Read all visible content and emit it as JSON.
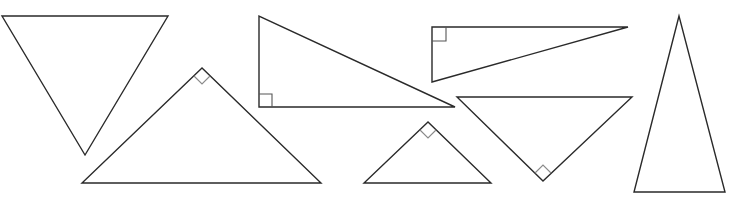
{
  "diagram": {
    "title": "",
    "stroke_color": "#2a2a2a",
    "right_angle_mark_color": "#555555",
    "background": "#ffffff",
    "shapes": [
      {
        "id": "triangle-1",
        "kind": "inverted-isosceles",
        "points": "2,16 168,16 85,155",
        "right_angle": false
      },
      {
        "id": "triangle-2",
        "kind": "right-isosceles",
        "points": "202,68 82,183 321,183",
        "right_angle": true,
        "right_angle_mark": "194,76 202,84 210,76"
      },
      {
        "id": "triangle-3",
        "kind": "right",
        "points": "259,16 259,107 455,107",
        "right_angle": true,
        "right_angle_mark": "259,94 272,94 272,107"
      },
      {
        "id": "triangle-4",
        "kind": "right",
        "points": "432,27 628,27 432,82",
        "right_angle": true,
        "right_angle_mark": "432,41 446,41 446,27"
      },
      {
        "id": "triangle-5",
        "kind": "right-isosceles",
        "points": "428,122 364,183 491,183",
        "right_angle": true,
        "right_angle_mark": "420,130 428,138 436,130"
      },
      {
        "id": "triangle-6",
        "kind": "inverted-right",
        "points": "457,97 632,97 543,181",
        "right_angle": true,
        "right_angle_mark": "535,173 543,165 551,173"
      },
      {
        "id": "triangle-7",
        "kind": "tall-isosceles",
        "points": "679,16 634,192 725,192",
        "right_angle": false
      }
    ]
  }
}
